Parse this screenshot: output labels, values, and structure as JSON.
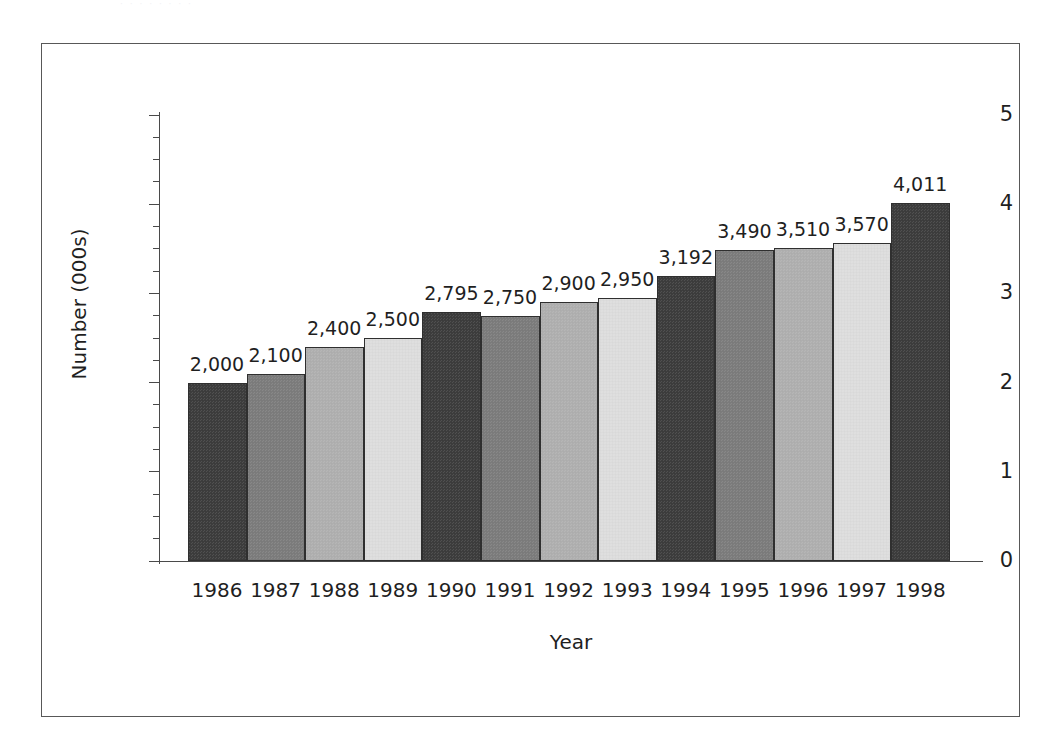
{
  "page": {
    "background": "#ffffff",
    "scan_residue_text": "· ·   ·     ·  ·   ·    ·  ·"
  },
  "figure": {
    "border_color": "#585858",
    "axis_color": "#4a4a4a",
    "text_color": "#1f1f1f"
  },
  "chart_data": {
    "type": "bar",
    "title": "",
    "xlabel": "Year",
    "ylabel": "Number (000s)",
    "categories": [
      "1986",
      "1987",
      "1988",
      "1989",
      "1990",
      "1991",
      "1992",
      "1993",
      "1994",
      "1995",
      "1996",
      "1997",
      "1998"
    ],
    "values": [
      2000,
      2100,
      2400,
      2500,
      2795,
      2750,
      2900,
      2950,
      3192,
      3490,
      3510,
      3570,
      4011
    ],
    "value_labels": [
      "2,000",
      "2,100",
      "2,400",
      "2,500",
      "2,795",
      "2,750",
      "2,900",
      "2,950",
      "3,192",
      "3,490",
      "3,510",
      "3,570",
      "4,011"
    ],
    "y_unit_scale": 1000,
    "ylim": [
      0,
      5
    ],
    "y_major_ticks": [
      0,
      1,
      2,
      3,
      4,
      5
    ],
    "y_tick_labels": [
      "0",
      "1",
      "2",
      "3",
      "4",
      "5"
    ],
    "y_minor_ticks": [
      0.25,
      0.5,
      0.75,
      1.25,
      1.5,
      1.75,
      2.25,
      2.5,
      2.75,
      3.25,
      3.5,
      3.75,
      4.25,
      4.5,
      4.75
    ],
    "grid": false,
    "legend": false,
    "legend_position": "none",
    "bar_colors": [
      "#3d3d3d",
      "#7d7d7d",
      "#b0b0b0",
      "#dedede",
      "#3d3d3d",
      "#7d7d7d",
      "#b0b0b0",
      "#dedede",
      "#3d3d3d",
      "#7d7d7d",
      "#b0b0b0",
      "#dedede",
      "#3d3d3d"
    ],
    "bar_border_color": "#2f2f2f",
    "bar_gap": 0
  }
}
